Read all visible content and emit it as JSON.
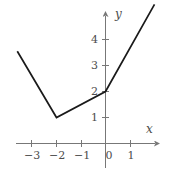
{
  "chart_data": {
    "type": "line",
    "title": "",
    "subtitle": "",
    "xlabel": "x",
    "ylabel": "y",
    "xlim": [
      -3.9,
      2.2
    ],
    "ylim": [
      -0.7,
      5.6
    ],
    "xticks": [
      -3,
      -2,
      -1,
      0,
      1
    ],
    "yticks": [
      1,
      2,
      3,
      4
    ],
    "xtick_labels": [
      "−3",
      "−2",
      "−1",
      "0",
      "1"
    ],
    "ytick_labels": [
      "1",
      "2",
      "3",
      "4"
    ],
    "grid": false,
    "legend": false,
    "axes_style": "arrow-tipped cartesian axes through origin",
    "series": [
      {
        "name": "piecewise-linear-graph",
        "kind": "polyline",
        "color": "#1a1a1a",
        "points": [
          {
            "x": -3.6,
            "y": 3.55
          },
          {
            "x": -2.0,
            "y": 1.0
          },
          {
            "x": 0.0,
            "y": 2.0
          },
          {
            "x": 2.0,
            "y": 5.35
          }
        ]
      }
    ],
    "vertices": [
      {
        "x": -2.0,
        "y": 1.0,
        "note": "minimum / corner point"
      },
      {
        "x": 0.0,
        "y": 2.0,
        "note": "corner point on y-axis"
      }
    ],
    "colors": {
      "curve": "#1a1a1a",
      "axis": "#777777",
      "tick": "#777777",
      "label": "#4d4d4d",
      "background": "#ffffff"
    }
  },
  "figure": {
    "axis_label_x": "x",
    "axis_label_y": "y",
    "tick_x_1": "−3",
    "tick_x_2": "−2",
    "tick_x_3": "−1",
    "tick_x_4": "0",
    "tick_x_5": "1",
    "tick_y_1": "1",
    "tick_y_2": "2",
    "tick_y_3": "3",
    "tick_y_4": "4"
  }
}
